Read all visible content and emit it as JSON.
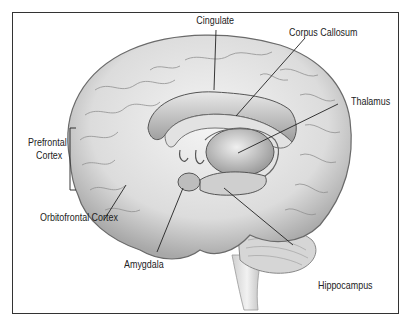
{
  "diagram": {
    "type": "anatomical illustration",
    "labels": [
      {
        "id": "cingulate",
        "text": "Cingulate"
      },
      {
        "id": "corpus_callosum",
        "text": "Corpus Callosum"
      },
      {
        "id": "thalamus",
        "text": "Thalamus"
      },
      {
        "id": "prefrontal_line1",
        "text": "Prefrontal"
      },
      {
        "id": "prefrontal_line2",
        "text": "Cortex"
      },
      {
        "id": "orbitofrontal",
        "text": "Orbitofrontal Cortex"
      },
      {
        "id": "amygdala",
        "text": "Amygdala"
      },
      {
        "id": "hippocampus",
        "text": "Hippocampus"
      }
    ],
    "colors": {
      "border": "#333333",
      "line": "#222222",
      "brain_light": "#efefef",
      "brain_mid": "#c8c8c8",
      "brain_dark": "#8a8a8a"
    }
  }
}
